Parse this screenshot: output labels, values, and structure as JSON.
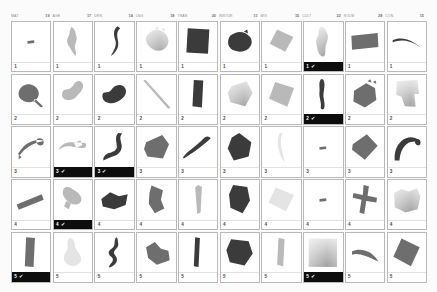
{
  "colors": {
    "page_background": "#fbfbfb",
    "cell_background": "#ffffff",
    "cell_border": "#b9b9b9",
    "selected_badge_background": "#0d0d0d",
    "selected_badge_text": "#ffffff",
    "badge_text": "#4a4a4a",
    "header_text": "#8b8b8b",
    "shape_dark": "#3b3b3b",
    "shape_mid": "#6e6e6e",
    "shape_light": "#b9b9b9",
    "shape_pale": "#e4e4e4"
  },
  "icons": {
    "check": "✔"
  },
  "header": {
    "columns": [
      {
        "label": "MAT",
        "count": "19"
      },
      {
        "label": "AGE",
        "count": "17"
      },
      {
        "label": "DRN",
        "count": "14"
      },
      {
        "label": "LNG",
        "count": "18"
      },
      {
        "label": "TRAN",
        "count": "20"
      },
      {
        "label": "INSTUR",
        "count": "11"
      },
      {
        "label": "MIX",
        "count": "15"
      },
      {
        "label": "CULT",
        "count": "22"
      },
      {
        "label": "ROLM",
        "count": "28"
      },
      {
        "label": "CON",
        "count": "15"
      }
    ]
  },
  "grid": {
    "rows": 5,
    "columns": 10,
    "cells": [
      {
        "rank": "1",
        "selected": false,
        "shape": "dash",
        "tone": "mid"
      },
      {
        "rank": "1",
        "selected": false,
        "shape": "blob-a",
        "tone": "light"
      },
      {
        "rank": "1",
        "selected": false,
        "shape": "curve-s",
        "tone": "dark"
      },
      {
        "rank": "1",
        "selected": false,
        "shape": "blob-b",
        "tone": "hatch"
      },
      {
        "rank": "1",
        "selected": false,
        "shape": "rect-tilt",
        "tone": "dark"
      },
      {
        "rank": "1",
        "selected": false,
        "shape": "blob-c",
        "tone": "dark"
      },
      {
        "rank": "1",
        "selected": false,
        "shape": "quad-a",
        "tone": "light"
      },
      {
        "rank": "1",
        "selected": true,
        "shape": "blob-d",
        "tone": "hatch"
      },
      {
        "rank": "1",
        "selected": false,
        "shape": "rect-flat",
        "tone": "mid"
      },
      {
        "rank": "1",
        "selected": false,
        "shape": "arc-thin",
        "tone": "dark"
      },
      {
        "rank": "2",
        "selected": false,
        "shape": "blob-e",
        "tone": "mid"
      },
      {
        "rank": "2",
        "selected": false,
        "shape": "blob-f",
        "tone": "light"
      },
      {
        "rank": "2",
        "selected": false,
        "shape": "blob-g",
        "tone": "dark"
      },
      {
        "rank": "2",
        "selected": false,
        "shape": "line-diag",
        "tone": "light"
      },
      {
        "rank": "2",
        "selected": false,
        "shape": "wedge",
        "tone": "dark"
      },
      {
        "rank": "2",
        "selected": false,
        "shape": "poly-a",
        "tone": "hatch"
      },
      {
        "rank": "2",
        "selected": false,
        "shape": "quad-b",
        "tone": "light"
      },
      {
        "rank": "2",
        "selected": true,
        "shape": "sliver",
        "tone": "dark"
      },
      {
        "rank": "2",
        "selected": false,
        "shape": "poly-b",
        "tone": "mid"
      },
      {
        "rank": "2",
        "selected": false,
        "shape": "poly-c",
        "tone": "hatch"
      },
      {
        "rank": "3",
        "selected": false,
        "shape": "hook",
        "tone": "mid"
      },
      {
        "rank": "3",
        "selected": true,
        "shape": "blob-h",
        "tone": "light"
      },
      {
        "rank": "3",
        "selected": true,
        "shape": "curve-l",
        "tone": "dark"
      },
      {
        "rank": "3",
        "selected": false,
        "shape": "poly-d",
        "tone": "mid"
      },
      {
        "rank": "3",
        "selected": false,
        "shape": "spike",
        "tone": "dark"
      },
      {
        "rank": "3",
        "selected": false,
        "shape": "poly-e",
        "tone": "dark"
      },
      {
        "rank": "3",
        "selected": false,
        "shape": "streak",
        "tone": "pale"
      },
      {
        "rank": "3",
        "selected": false,
        "shape": "dash",
        "tone": "mid"
      },
      {
        "rank": "3",
        "selected": false,
        "shape": "poly-f",
        "tone": "mid"
      },
      {
        "rank": "3",
        "selected": false,
        "shape": "arc-hook",
        "tone": "dark"
      },
      {
        "rank": "4",
        "selected": false,
        "shape": "bar-tilt",
        "tone": "mid"
      },
      {
        "rank": "4",
        "selected": true,
        "shape": "blob-i",
        "tone": "light"
      },
      {
        "rank": "4",
        "selected": false,
        "shape": "poly-g",
        "tone": "dark"
      },
      {
        "rank": "4",
        "selected": false,
        "shape": "poly-h",
        "tone": "mid"
      },
      {
        "rank": "4",
        "selected": false,
        "shape": "cone",
        "tone": "light"
      },
      {
        "rank": "4",
        "selected": false,
        "shape": "poly-i",
        "tone": "dark"
      },
      {
        "rank": "4",
        "selected": false,
        "shape": "quad-c",
        "tone": "pale"
      },
      {
        "rank": "4",
        "selected": false,
        "shape": "dash",
        "tone": "mid"
      },
      {
        "rank": "4",
        "selected": false,
        "shape": "fork",
        "tone": "mid"
      },
      {
        "rank": "4",
        "selected": false,
        "shape": "fan",
        "tone": "hatch"
      },
      {
        "rank": "5",
        "selected": true,
        "shape": "bar-vert",
        "tone": "mid"
      },
      {
        "rank": "5",
        "selected": false,
        "shape": "blob-j",
        "tone": "pale"
      },
      {
        "rank": "5",
        "selected": false,
        "shape": "zigzag",
        "tone": "dark"
      },
      {
        "rank": "5",
        "selected": false,
        "shape": "boot",
        "tone": "mid"
      },
      {
        "rank": "5",
        "selected": false,
        "shape": "stick",
        "tone": "dark"
      },
      {
        "rank": "5",
        "selected": false,
        "shape": "poly-j",
        "tone": "dark"
      },
      {
        "rank": "5",
        "selected": false,
        "shape": "strip",
        "tone": "light"
      },
      {
        "rank": "5",
        "selected": true,
        "shape": "square-big",
        "tone": "hatch"
      },
      {
        "rank": "5",
        "selected": false,
        "shape": "sweep",
        "tone": "mid"
      },
      {
        "rank": "5",
        "selected": false,
        "shape": "rect-rot",
        "tone": "mid"
      }
    ]
  }
}
